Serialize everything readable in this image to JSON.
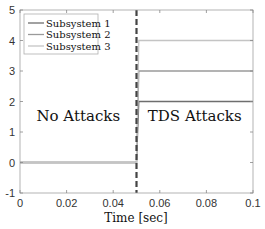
{
  "chart_data": {
    "type": "line",
    "title": "",
    "xlabel": "Time [sec]",
    "ylabel": "",
    "xlim": [
      0,
      0.1
    ],
    "ylim": [
      -1,
      5
    ],
    "xticks": [
      0,
      0.02,
      0.04,
      0.06,
      0.08,
      0.1
    ],
    "xtick_labels": [
      "0",
      "0.02",
      "0.04",
      "0.06",
      "0.08",
      "0.1"
    ],
    "yticks": [
      -1,
      0,
      1,
      2,
      3,
      4,
      5
    ],
    "ytick_labels": [
      "-1",
      "0",
      "1",
      "2",
      "3",
      "4",
      "5"
    ],
    "grid": false,
    "legend_position": "upper-left",
    "series": [
      {
        "name": "Subsystem 1",
        "color": "#6e6e6e",
        "x": [
          0,
          0.05,
          0.051,
          0.1
        ],
        "values": [
          0,
          0,
          2,
          2
        ]
      },
      {
        "name": "Subsystem 2",
        "color": "#9a9a9a",
        "x": [
          0,
          0.05,
          0.051,
          0.1
        ],
        "values": [
          0,
          0,
          3,
          3
        ]
      },
      {
        "name": "Subsystem 3",
        "color": "#c4c4c4",
        "x": [
          0,
          0.05,
          0.051,
          0.1
        ],
        "values": [
          0,
          0,
          4,
          4
        ]
      }
    ],
    "vertical_marker": {
      "x": 0.05,
      "style": "dashed",
      "color": "#444444"
    },
    "annotations": [
      {
        "text": "No Attacks",
        "x": 0.025,
        "y": 1.5
      },
      {
        "text": "TDS Attacks",
        "x": 0.075,
        "y": 1.5
      }
    ]
  }
}
